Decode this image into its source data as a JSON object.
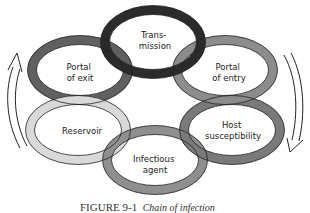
{
  "diagram": {
    "title": "Chain of infection",
    "caption": {
      "figure": "FIGURE 9-1",
      "text": "Chain of infection"
    },
    "links": [
      {
        "id": "transmission",
        "lines": [
          "Trans-",
          "mission"
        ],
        "color": "#2b2b2b"
      },
      {
        "id": "portal-of-entry",
        "lines": [
          "Portal",
          "of entry"
        ],
        "color": "#8c8c8c"
      },
      {
        "id": "host-susceptibility",
        "lines": [
          "Host",
          "susceptibility"
        ],
        "color": "#7a7a7a"
      },
      {
        "id": "infectious-agent",
        "lines": [
          "Infectious",
          "agent"
        ],
        "color": "#8f8f8f"
      },
      {
        "id": "reservoir",
        "lines": [
          "Reservoir"
        ],
        "color": "#d9d9d9"
      },
      {
        "id": "portal-of-exit",
        "lines": [
          "Portal",
          "of exit"
        ],
        "color": "#606060"
      }
    ],
    "arrows": {
      "left": "upward-curved-arrow",
      "right": "downward-curved-arrow"
    }
  }
}
